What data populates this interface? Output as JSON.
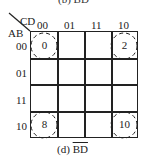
{
  "previous_caption": "(b) BD",
  "kmap": {
    "corner_top": "CD",
    "corner_left": "AB",
    "col_headers": [
      "00",
      "01",
      "11",
      "10"
    ],
    "row_headers": [
      "00",
      "01",
      "11",
      "10"
    ],
    "cells": [
      {
        "row": 0,
        "col": 0,
        "value": "0",
        "circled": true
      },
      {
        "row": 0,
        "col": 3,
        "value": "2",
        "circled": true
      },
      {
        "row": 3,
        "col": 0,
        "value": "8",
        "circled": true
      },
      {
        "row": 3,
        "col": 3,
        "value": "10",
        "circled": true
      }
    ],
    "grouping_style": "dashed-circle"
  },
  "caption": {
    "prefix": "(d)",
    "term_B": "B",
    "term_D": "D",
    "expression": "B̄D̄"
  }
}
